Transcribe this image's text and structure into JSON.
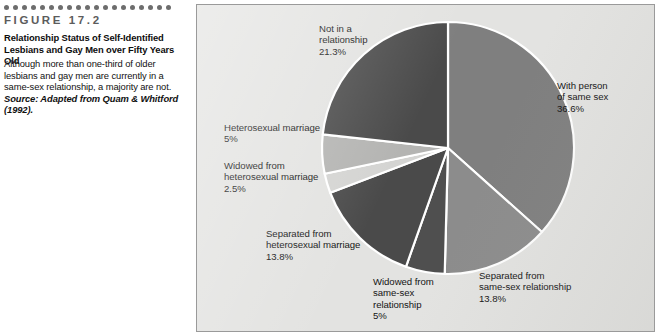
{
  "figure": {
    "number": "FIGURE 17.2",
    "title": "Relationship Status of Self-Identified Lesbians and Gay Men over Fifty Years Old",
    "description": "Although more than one-third of older lesbians and gay men are currently in a same-sex relationship, a majority are not.",
    "source": "Source: Adapted from Quam & Whitford (1992).",
    "dot_count": 19,
    "dot_color": "#6d6d6d"
  },
  "chart_data": {
    "type": "pie",
    "title": "Relationship Status of Self-Identified Lesbians and Gay Men over Fifty Years Old",
    "start_angle_deg": 0,
    "direction": "clockwise",
    "legend": "none-inline-labels",
    "total_percent": 98.0,
    "categories": [
      "With person of same sex",
      "Separated from same-sex relationship",
      "Widowed from same-sex relationship",
      "Separated from heterosexual marriage",
      "Widowed from heterosexual marriage",
      "Heterosexual marriage",
      "Not in a relationship"
    ],
    "values": [
      36.6,
      13.8,
      5,
      13.8,
      2.5,
      5,
      21.3
    ],
    "value_labels": [
      "36.6%",
      "13.8%",
      "5%",
      "13.8%",
      "2.5%",
      "5%",
      "21.3%"
    ],
    "colors": [
      "#7f7f7f",
      "#8c8c8c",
      "#4f4f4f",
      "#4a4a4a",
      "#d4d4d2",
      "#b4b4b2",
      "#4a4a4a"
    ],
    "slices": [
      {
        "name": "with-person-of-same-sex",
        "label": "With person\nof same sex",
        "percent_text": "36.6%",
        "value": 36.6,
        "color": "#7f7f7f",
        "start_deg": 0,
        "end_deg": 131.8
      },
      {
        "name": "separated-from-same-sex-relationship",
        "label": "Separated from\nsame-sex relationship",
        "percent_text": "13.8%",
        "value": 13.8,
        "color": "#8c8c8c",
        "start_deg": 131.8,
        "end_deg": 181.5
      },
      {
        "name": "widowed-from-same-sex-relationship",
        "label": "Widowed from\nsame-sex\nrelationship",
        "percent_text": "5%",
        "value": 5,
        "color": "#4f4f4f",
        "start_deg": 181.5,
        "end_deg": 199.5
      },
      {
        "name": "separated-from-heterosexual-marriage",
        "label": "Separated from\nheterosexual marriage",
        "percent_text": "13.8%",
        "value": 13.8,
        "color": "#4a4a4a",
        "start_deg": 199.5,
        "end_deg": 249.2
      },
      {
        "name": "widowed-from-heterosexual-marriage",
        "label": "Widowed from\nheterosexual marriage",
        "percent_text": "2.5%",
        "value": 2.5,
        "color": "#d4d4d2",
        "start_deg": 249.2,
        "end_deg": 258.2
      },
      {
        "name": "heterosexual-marriage",
        "label": "Heterosexual marriage",
        "percent_text": "5%",
        "value": 5,
        "color": "#b4b4b2",
        "start_deg": 258.2,
        "end_deg": 276.2
      },
      {
        "name": "not-in-a-relationship",
        "label": "Not in a\nrelationship",
        "percent_text": "21.3%",
        "value": 21.3,
        "color": "#4a4a4a",
        "start_deg": 276.2,
        "end_deg": 360
      }
    ]
  },
  "labels": {
    "not_in_relationship": "Not in a\nrelationship\n21.3%",
    "with_person_same_sex": "With person\nof same sex\n36.6%",
    "separated_same_sex": "Separated from\nsame-sex relationship\n13.8%",
    "widowed_same_sex": "Widowed from\nsame-sex\nrelationship\n5%",
    "separated_heterosexual": "Separated from\nheterosexual marriage\n13.8%",
    "widowed_heterosexual": "Widowed from\nheterosexual marriage\n2.5%",
    "heterosexual_marriage": "Heterosexual marriage\n5%"
  },
  "panel": {
    "background": "#e3e3e1",
    "border_color": "#9a9a9a",
    "separator_color": "#ffffff"
  }
}
